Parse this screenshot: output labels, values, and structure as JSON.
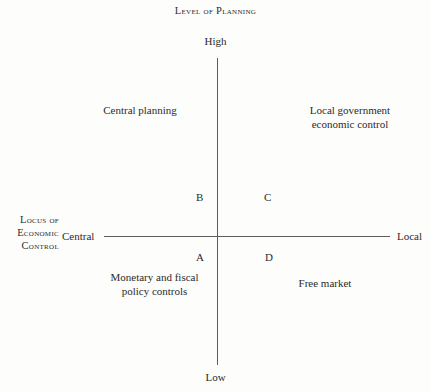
{
  "figure": {
    "title": "Level of Planning",
    "axes": {
      "vertical": {
        "top_label": "High",
        "bottom_label": "Low"
      },
      "horizontal": {
        "name_line1": "Locus of",
        "name_line2": "Economic",
        "name_line3": "Control",
        "left_label": "Central",
        "right_label": "Local"
      }
    },
    "quadrants": {
      "upper_left": {
        "line1": "Central planning"
      },
      "upper_right": {
        "line1": "Local government",
        "line2": "economic control"
      },
      "lower_left": {
        "line1": "Monetary and fiscal",
        "line2": "policy controls"
      },
      "lower_right": {
        "line1": "Free market"
      }
    },
    "markers": {
      "a": "A",
      "b": "B",
      "c": "C",
      "d": "D"
    },
    "colors": {
      "background": "#fdfdfc",
      "axis": "#5d5d5d",
      "text": "#2b2b2b"
    }
  }
}
